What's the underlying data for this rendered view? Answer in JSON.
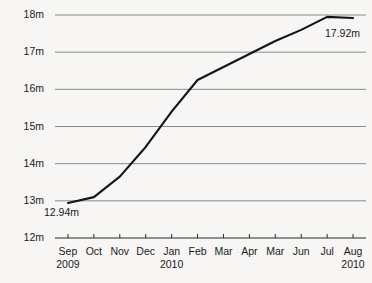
{
  "chart_data": {
    "type": "line",
    "title": "",
    "xlabel": "",
    "ylabel": "",
    "ylim": [
      12,
      18
    ],
    "ytick_values": [
      12,
      13,
      14,
      15,
      16,
      17,
      18
    ],
    "ytick_labels": [
      "12m",
      "13m",
      "14m",
      "15m",
      "16m",
      "17m",
      "18m"
    ],
    "grid": true,
    "legend": "none",
    "categories": [
      "Sep",
      "Oct",
      "Nov",
      "Dec",
      "Jan",
      "Feb",
      "Mar",
      "Apr",
      "Mar",
      "Jun",
      "Jul",
      "Aug"
    ],
    "years": [
      "2009",
      "",
      "",
      "",
      "2010",
      "",
      "",
      "",
      "",
      "",
      "",
      "2010"
    ],
    "values": [
      12.94,
      13.1,
      13.65,
      14.45,
      15.4,
      16.25,
      16.6,
      16.95,
      17.3,
      17.6,
      17.95,
      17.92
    ],
    "annotations": [
      {
        "name": "first-point",
        "text": "12.94m",
        "category": "Sep",
        "value": 12.94
      },
      {
        "name": "last-point",
        "text": "17.92m",
        "category": "Aug",
        "value": 17.92
      }
    ],
    "colors": {
      "line": "#141414",
      "grid": "#8a8a8a",
      "axis": "#2b2b2b",
      "background": "#f7f6f4",
      "text": "#1a1a1a"
    }
  }
}
